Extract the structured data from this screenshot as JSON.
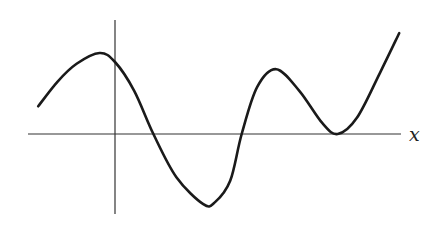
{
  "chart_data": {
    "type": "line",
    "title": "",
    "xlabel": "x",
    "ylabel": "",
    "grid": false,
    "legend": null,
    "xlim": [
      -2.0,
      8.0
    ],
    "ylim": [
      -2.2,
      3.0
    ],
    "series": [
      {
        "name": "f(x)",
        "points": [
          [
            -2.0,
            0.77
          ],
          [
            -1.5,
            1.45
          ],
          [
            -1.0,
            1.95
          ],
          [
            -0.4,
            2.25
          ],
          [
            0.0,
            2.0
          ],
          [
            0.5,
            1.2
          ],
          [
            1.0,
            0.0
          ],
          [
            1.6,
            -1.2
          ],
          [
            2.3,
            -1.95
          ],
          [
            2.6,
            -1.9
          ],
          [
            3.0,
            -1.3
          ],
          [
            3.3,
            0.0
          ],
          [
            3.7,
            1.3
          ],
          [
            4.2,
            1.8
          ],
          [
            4.8,
            1.2
          ],
          [
            5.4,
            0.3
          ],
          [
            5.8,
            0.0
          ],
          [
            6.3,
            0.45
          ],
          [
            6.9,
            1.7
          ],
          [
            7.4,
            2.8
          ]
        ]
      }
    ],
    "features": {
      "roots": [
        1.0,
        3.3,
        5.8
      ],
      "double_root": 5.8,
      "local_maxima": [
        [
          -0.4,
          2.25
        ],
        [
          4.2,
          1.8
        ]
      ],
      "local_minima": [
        [
          2.4,
          -1.98
        ],
        [
          5.8,
          0.0
        ]
      ]
    }
  }
}
